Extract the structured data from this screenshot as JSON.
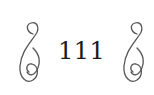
{
  "page": {
    "number": "111",
    "ornaments": {
      "left": "swirl-ornament",
      "right": "swirl-ornament"
    },
    "colors": {
      "text": "#1a1a1a",
      "ornament": "#555555",
      "background": "#ffffff"
    }
  }
}
